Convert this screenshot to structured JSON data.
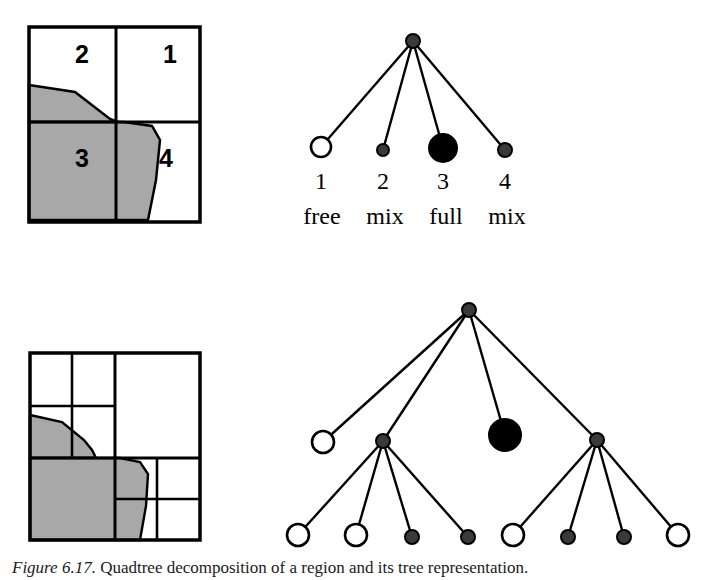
{
  "figure": {
    "caption_label": "Figure 6.17.",
    "caption_text": "Quadtree decomposition of a region and its tree representation."
  },
  "top_panel": {
    "grid": {
      "cells": [
        {
          "id": "q1",
          "label": "1",
          "state": "free",
          "x": 170,
          "y": 63
        },
        {
          "id": "q2",
          "label": "2",
          "state": "mix",
          "x": 82,
          "y": 63
        },
        {
          "id": "q3",
          "label": "3",
          "state": "full",
          "x": 82,
          "y": 157
        },
        {
          "id": "q4",
          "label": "4",
          "state": "mix",
          "x": 170,
          "y": 157
        }
      ]
    },
    "tree": {
      "root": {
        "id": "root",
        "state": "mix",
        "cx": 413,
        "cy": 41,
        "r": 7
      },
      "children": [
        {
          "id": "n1",
          "state": "free",
          "cx": 321,
          "cy": 147,
          "r": 10,
          "number": "1",
          "word": "free"
        },
        {
          "id": "n2",
          "state": "mix",
          "cx": 383,
          "cy": 150,
          "r": 6,
          "number": "2",
          "word": "mix"
        },
        {
          "id": "n3",
          "state": "full",
          "cx": 443,
          "cy": 148,
          "r": 14,
          "number": "3",
          "word": "full"
        },
        {
          "id": "n4",
          "state": "mix",
          "cx": 505,
          "cy": 150,
          "r": 7,
          "number": "4",
          "word": "mix"
        }
      ]
    }
  },
  "bottom_panel": {
    "tree": {
      "root": {
        "id": "b-root",
        "state": "mix",
        "cx": 469,
        "cy": 310,
        "r": 7
      },
      "level1": [
        {
          "id": "b-l1-a",
          "state": "free",
          "cx": 323,
          "cy": 442,
          "r": 11
        },
        {
          "id": "b-l1-b",
          "state": "mix",
          "cx": 383,
          "cy": 441,
          "r": 7
        },
        {
          "id": "b-l1-c",
          "state": "full",
          "cx": 505,
          "cy": 435,
          "r": 16
        },
        {
          "id": "b-l1-d",
          "state": "mix",
          "cx": 597,
          "cy": 440,
          "r": 7
        }
      ],
      "level2_left": [
        {
          "id": "b-l2-1",
          "state": "free",
          "cx": 298,
          "cy": 535,
          "r": 11
        },
        {
          "id": "b-l2-2",
          "state": "free",
          "cx": 356,
          "cy": 535,
          "r": 11
        },
        {
          "id": "b-l2-3",
          "state": "mix",
          "cx": 412,
          "cy": 537,
          "r": 7
        },
        {
          "id": "b-l2-4",
          "state": "mix",
          "cx": 468,
          "cy": 537,
          "r": 7
        }
      ],
      "level2_right": [
        {
          "id": "b-l2-5",
          "state": "free",
          "cx": 513,
          "cy": 535,
          "r": 11
        },
        {
          "id": "b-l2-6",
          "state": "mix",
          "cx": 568,
          "cy": 537,
          "r": 7
        },
        {
          "id": "b-l2-7",
          "state": "mix",
          "cx": 624,
          "cy": 537,
          "r": 7
        },
        {
          "id": "b-l2-8",
          "state": "free",
          "cx": 678,
          "cy": 535,
          "r": 11
        }
      ]
    }
  },
  "colors": {
    "stroke": "#000000",
    "shaded_region": "#a8a8a8",
    "free_fill": "#ffffff",
    "full_fill": "#000000",
    "mix_fill": "#3a3a3a",
    "background": "#ffffff"
  },
  "legend_terms": {
    "free": "free",
    "mix": "mix",
    "full": "full"
  }
}
